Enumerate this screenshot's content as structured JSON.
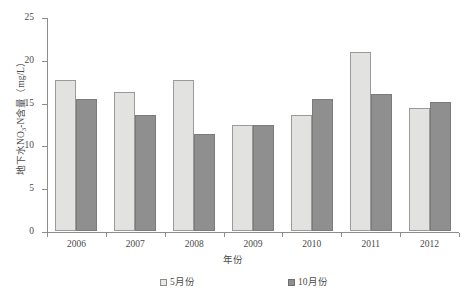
{
  "chart_data": {
    "type": "bar",
    "title": "",
    "xlabel": "年份",
    "ylabel": "地下水NO₃-N含量（mg/L）",
    "categories": [
      "2006",
      "2007",
      "2008",
      "2009",
      "2010",
      "2011",
      "2012"
    ],
    "series": [
      {
        "name": "5月份",
        "color": "#e2e2e0",
        "values": [
          17.7,
          16.2,
          17.6,
          12.4,
          13.6,
          20.9,
          14.4
        ]
      },
      {
        "name": "10月份",
        "color": "#8f8f8f",
        "values": [
          15.4,
          13.5,
          11.3,
          12.4,
          15.4,
          16.0,
          15.1
        ]
      }
    ],
    "ylim": [
      0,
      25
    ],
    "yticks": [
      0,
      5,
      10,
      15,
      20,
      25
    ],
    "ytick_labels": [
      "0",
      "5",
      "10",
      "15",
      "20",
      "25"
    ],
    "grid": false,
    "legend_position": "bottom"
  },
  "axis": {
    "y_title_prefix": "地下水NO",
    "y_title_sub": "3",
    "y_title_suffix": "-N含量（mg/L）",
    "x_title": "年份"
  },
  "legend": {
    "items": [
      {
        "label": "5月份"
      },
      {
        "label": "10月份"
      }
    ]
  }
}
